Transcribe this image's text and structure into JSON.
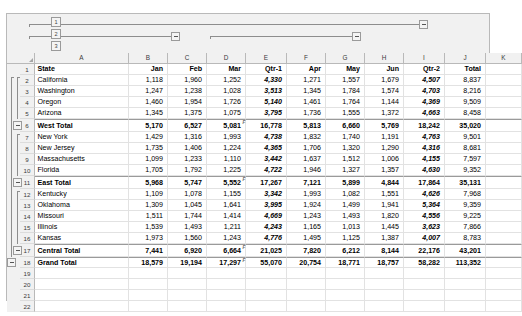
{
  "app": {
    "type": "spreadsheet",
    "grid_style": "excel-outline-grouped"
  },
  "outline": {
    "row_levels": [
      "1",
      "2",
      "3"
    ],
    "col_levels": [
      "1",
      "2",
      "3"
    ],
    "collapse_glyph": "minus",
    "row_group_buttons": [
      "minus",
      "minus",
      "minus",
      "minus"
    ],
    "col_group_buttons": [
      "minus",
      "minus",
      "minus"
    ]
  },
  "columns": [
    {
      "letter": "A",
      "width": 94,
      "align": "left"
    },
    {
      "letter": "B",
      "width": 39,
      "align": "right"
    },
    {
      "letter": "C",
      "width": 39,
      "align": "right"
    },
    {
      "letter": "D",
      "width": 39,
      "align": "right"
    },
    {
      "letter": "E",
      "width": 41,
      "align": "right"
    },
    {
      "letter": "F",
      "width": 39,
      "align": "right"
    },
    {
      "letter": "G",
      "width": 39,
      "align": "right"
    },
    {
      "letter": "H",
      "width": 39,
      "align": "right"
    },
    {
      "letter": "I",
      "width": 41,
      "align": "right"
    },
    {
      "letter": "J",
      "width": 41,
      "align": "right"
    },
    {
      "letter": "K",
      "width": 36,
      "align": "right"
    }
  ],
  "header_row": {
    "number": "1",
    "cells": [
      "State",
      "Jan",
      "Feb",
      "Mar",
      "Qtr-1",
      "Apr",
      "May",
      "Jun",
      "Qtr-2",
      "Total",
      ""
    ]
  },
  "rows": [
    {
      "number": "2",
      "kind": "data",
      "cells": [
        "California",
        "1,118",
        "1,960",
        "1,252",
        "4,330",
        "1,271",
        "1,557",
        "1,679",
        "4,507",
        "8,837",
        ""
      ]
    },
    {
      "number": "3",
      "kind": "data",
      "cells": [
        "Washington",
        "1,247",
        "1,238",
        "1,028",
        "3,513",
        "1,345",
        "1,784",
        "1,574",
        "4,703",
        "8,216",
        ""
      ]
    },
    {
      "number": "4",
      "kind": "data",
      "cells": [
        "Oregon",
        "1,460",
        "1,954",
        "1,726",
        "5,140",
        "1,461",
        "1,764",
        "1,144",
        "4,369",
        "9,509",
        ""
      ]
    },
    {
      "number": "5",
      "kind": "data",
      "cells": [
        "Arizona",
        "1,345",
        "1,375",
        "1,075",
        "3,795",
        "1,736",
        "1,555",
        "1,372",
        "4,663",
        "8,458",
        ""
      ]
    },
    {
      "number": "6",
      "kind": "total",
      "cells": [
        "West Total",
        "5,170",
        "6,527",
        "5,081",
        "16,778",
        "5,813",
        "6,660",
        "5,769",
        "18,242",
        "35,020",
        ""
      ]
    },
    {
      "number": "7",
      "kind": "data",
      "cells": [
        "New York",
        "1,429",
        "1,316",
        "1,993",
        "4,738",
        "1,832",
        "1,740",
        "1,191",
        "4,763",
        "9,501",
        ""
      ]
    },
    {
      "number": "8",
      "kind": "data",
      "cells": [
        "New Jersey",
        "1,735",
        "1,406",
        "1,224",
        "4,365",
        "1,706",
        "1,320",
        "1,290",
        "4,316",
        "8,681",
        ""
      ]
    },
    {
      "number": "9",
      "kind": "data",
      "cells": [
        "Massachusetts",
        "1,099",
        "1,233",
        "1,110",
        "3,442",
        "1,637",
        "1,512",
        "1,006",
        "4,155",
        "7,597",
        ""
      ]
    },
    {
      "number": "10",
      "kind": "data",
      "cells": [
        "Florida",
        "1,705",
        "1,792",
        "1,225",
        "4,722",
        "1,946",
        "1,327",
        "1,357",
        "4,630",
        "9,352",
        ""
      ]
    },
    {
      "number": "11",
      "kind": "total",
      "cells": [
        "East Total",
        "5,968",
        "5,747",
        "5,552",
        "17,267",
        "7,121",
        "5,899",
        "4,844",
        "17,864",
        "35,131",
        ""
      ]
    },
    {
      "number": "12",
      "kind": "data",
      "cells": [
        "Kentucky",
        "1,109",
        "1,078",
        "1,155",
        "3,342",
        "1,993",
        "1,082",
        "1,551",
        "4,626",
        "7,968",
        ""
      ]
    },
    {
      "number": "13",
      "kind": "data",
      "cells": [
        "Oklahoma",
        "1,309",
        "1,045",
        "1,641",
        "3,995",
        "1,924",
        "1,499",
        "1,941",
        "5,364",
        "9,359",
        ""
      ]
    },
    {
      "number": "14",
      "kind": "data",
      "cells": [
        "Missouri",
        "1,511",
        "1,744",
        "1,414",
        "4,669",
        "1,243",
        "1,493",
        "1,820",
        "4,556",
        "9,225",
        ""
      ]
    },
    {
      "number": "15",
      "kind": "data",
      "cells": [
        "Illinois",
        "1,539",
        "1,493",
        "1,211",
        "4,243",
        "1,165",
        "1,013",
        "1,445",
        "3,623",
        "7,866",
        ""
      ]
    },
    {
      "number": "16",
      "kind": "data",
      "cells": [
        "Kansas",
        "1,973",
        "1,560",
        "1,243",
        "4,776",
        "1,495",
        "1,125",
        "1,387",
        "4,007",
        "8,783",
        ""
      ]
    },
    {
      "number": "17",
      "kind": "total",
      "cells": [
        "Central Total",
        "7,441",
        "6,920",
        "6,664",
        "21,025",
        "7,820",
        "6,212",
        "8,144",
        "22,176",
        "43,201",
        ""
      ]
    },
    {
      "number": "18",
      "kind": "grand",
      "cells": [
        "Grand Total",
        "18,579",
        "19,194",
        "17,297",
        "55,070",
        "20,754",
        "18,771",
        "18,757",
        "58,282",
        "113,352",
        ""
      ]
    },
    {
      "number": "19",
      "kind": "empty",
      "cells": [
        "",
        "",
        "",
        "",
        "",
        "",
        "",
        "",
        "",
        "",
        ""
      ]
    },
    {
      "number": "20",
      "kind": "empty",
      "cells": [
        "",
        "",
        "",
        "",
        "",
        "",
        "",
        "",
        "",
        "",
        ""
      ]
    },
    {
      "number": "21",
      "kind": "empty",
      "cells": [
        "",
        "",
        "",
        "",
        "",
        "",
        "",
        "",
        "",
        "",
        ""
      ]
    },
    {
      "number": "22",
      "kind": "empty",
      "cells": [
        "",
        "",
        "",
        "",
        "",
        "",
        "",
        "",
        "",
        "",
        ""
      ]
    }
  ],
  "formula_marks": [
    "D6",
    "D11",
    "D17",
    "D18"
  ],
  "colors": {
    "grid_line": "#e2e2e2",
    "header_bg": "#f1f1f1",
    "header_text": "#3a3a3a",
    "frame_border": "#b9b9b9",
    "total_rule": "#9a9a9a",
    "cell_bg": "#ffffff",
    "text": "#000000"
  }
}
